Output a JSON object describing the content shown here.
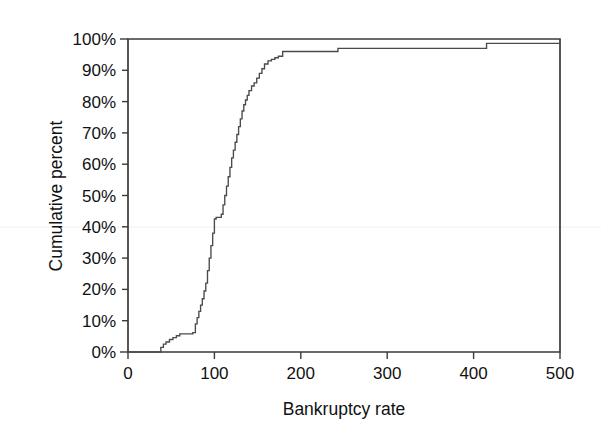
{
  "chart_data": {
    "type": "line",
    "subtype": "empirical-cumulative-distribution-step",
    "title": "",
    "xlabel": "Bankruptcy rate",
    "ylabel": "Cumulative percent",
    "xlim": [
      0,
      500
    ],
    "ylim": [
      0,
      100
    ],
    "xticks": [
      0,
      100,
      200,
      300,
      400,
      500
    ],
    "xtick_labels": [
      "0",
      "100",
      "200",
      "300",
      "400",
      "500"
    ],
    "yticks": [
      0,
      10,
      20,
      30,
      40,
      50,
      60,
      70,
      80,
      90,
      100
    ],
    "ytick_labels": [
      "0%",
      "10%",
      "20%",
      "30%",
      "40%",
      "50%",
      "60%",
      "70%",
      "80%",
      "90%",
      "100%"
    ],
    "grid": false,
    "legend": null,
    "line_color": "#4a4a4a",
    "frame_color": "#3a3a3a",
    "background": "#ffffff",
    "series": [
      {
        "name": "Cumulative percent",
        "x": [
          0,
          34,
          38,
          41,
          44,
          48,
          52,
          56,
          60,
          64,
          68,
          72,
          75,
          78,
          80,
          82,
          84,
          86,
          88,
          90,
          92,
          94,
          96,
          98,
          100,
          102,
          104,
          106,
          108,
          110,
          112,
          114,
          116,
          118,
          120,
          122,
          124,
          126,
          128,
          130,
          132,
          134,
          136,
          138,
          140,
          143,
          146,
          149,
          152,
          155,
          158,
          162,
          166,
          170,
          174,
          179,
          186,
          243,
          415,
          500
        ],
        "y": [
          0,
          0,
          1.5,
          2.5,
          3.2,
          4.0,
          4.6,
          5.2,
          5.8,
          5.8,
          5.8,
          5.8,
          6.2,
          9.0,
          11.0,
          13.0,
          15.0,
          17.0,
          19.5,
          22.0,
          26.0,
          30.0,
          34.0,
          38.0,
          42.5,
          43.0,
          43.0,
          43.0,
          44.0,
          47.0,
          50.0,
          53.0,
          56.0,
          59.0,
          62.0,
          64.5,
          67.0,
          69.5,
          72.0,
          74.5,
          77.0,
          79.0,
          80.5,
          82.0,
          83.5,
          85.0,
          86.0,
          87.5,
          89.0,
          90.5,
          92.0,
          93.0,
          93.5,
          94.0,
          94.5,
          96.0,
          96.0,
          97.0,
          98.6,
          98.6
        ]
      }
    ],
    "annotations": []
  },
  "axes": {
    "x_axis_title": "Bankruptcy rate",
    "y_axis_title": "Cumulative percent",
    "x_tick_labels": [
      "0",
      "100",
      "200",
      "300",
      "400",
      "500"
    ],
    "y_tick_labels": [
      "100%",
      "90%",
      "80%",
      "70%",
      "60%",
      "50%",
      "40%",
      "30%",
      "20%",
      "10%",
      "0%"
    ]
  }
}
